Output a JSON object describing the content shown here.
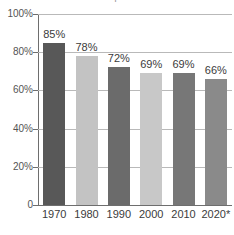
{
  "title_sliver": "p",
  "chart_data": {
    "type": "bar",
    "title": "",
    "xlabel": "",
    "ylabel": "",
    "categories": [
      "1970",
      "1980",
      "1990",
      "2000",
      "2010",
      "2020*"
    ],
    "values": [
      85,
      78,
      72,
      69,
      69,
      66
    ],
    "value_labels": [
      "85%",
      "78%",
      "72%",
      "69%",
      "69%",
      "66%"
    ],
    "ylim": [
      0,
      100
    ],
    "ytick_values": [
      100,
      80,
      60,
      40,
      20,
      0
    ],
    "ytick_labels": [
      "100%",
      "80%",
      "60%",
      "40%",
      "20%",
      "0"
    ],
    "grid": true,
    "legend": "none",
    "bar_colors": [
      "#585858",
      "#c3c3c3",
      "#6b6b6b",
      "#c8c8c8",
      "#777777",
      "#8a8a8a"
    ],
    "axis_color": "#6e6e6e",
    "gridline_color": "#b9b9b9",
    "text_color": "#3b3b3b",
    "background": "#ffffff"
  }
}
